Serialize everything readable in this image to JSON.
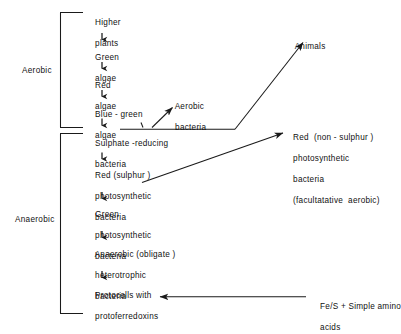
{
  "figure": {
    "type": "flow-diagram",
    "title": "",
    "background_color": "#ffffff",
    "line_color": "#1a1a1a",
    "text_color": "#111111"
  },
  "groups": {
    "aerobic_label": "Aerobic",
    "anaerobic_label": "Anaerobic"
  },
  "chain": {
    "aerobic_nodes": [
      {
        "line1": "Higher",
        "line2": "plants",
        "line3": ""
      },
      {
        "line1": "Green",
        "line2": "algae",
        "line3": ""
      },
      {
        "line1": "Red",
        "line2": "algae",
        "line3": ""
      },
      {
        "line1": "Blue - green",
        "line2": "algae",
        "line3": ""
      }
    ],
    "anaerobic_nodes": [
      {
        "line1": "Sulphate -reducing",
        "line2": "bacteria",
        "line3": ""
      },
      {
        "line1": "Red (sulphur )",
        "line2": "photosynthetic",
        "line3": "bacteria"
      },
      {
        "line1": "Green",
        "line2": "photosynthetic",
        "line3": "bacteria"
      },
      {
        "line1": "Anaerobic (obligate )",
        "line2": "heterotrophic",
        "line3": "bacteria"
      },
      {
        "line1": "Protocells with",
        "line2": "protoferredoxins",
        "line3": ""
      }
    ]
  },
  "branches": {
    "aerobic_bacteria": {
      "line1": "Aerobic",
      "line2": "bacteria"
    },
    "animals": {
      "line1": "Animals"
    },
    "red_non_sulphur": {
      "line1": "Red  (non - sulphur )",
      "line2": "photosynthetic",
      "line3": "bacteria",
      "line4": "(facultatative  aerobic)"
    },
    "precursors": {
      "line1": "Fe/S + Simple amino",
      "line2": "acids"
    }
  }
}
